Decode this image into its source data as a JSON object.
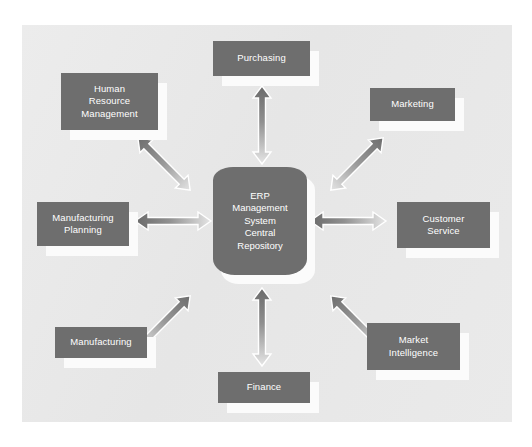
{
  "diagram": {
    "title": "ERP Management System Central Repository",
    "center": {
      "name": "erp-central-repository",
      "label": "ERP\nManagement\nSystem\nCentral\nRepository"
    },
    "colors": {
      "panel_background": "#e9e9e9",
      "canvas_background": "#ffffff",
      "box_fill": "#6e6e6e",
      "box_text": "#ffffff",
      "box_shadow": "#fbfbfb",
      "arrow_dark": "#6f6f6f",
      "arrow_light": "#e3e3e3",
      "arrow_outline": "#ffffff"
    },
    "modules": [
      {
        "id": "purchasing",
        "label": "Purchasing",
        "position": "top"
      },
      {
        "id": "human-resource-management",
        "label": "Human\nResource\nManagement",
        "position": "top-left"
      },
      {
        "id": "marketing",
        "label": "Marketing",
        "position": "top-right"
      },
      {
        "id": "manufacturing-planning",
        "label": "Manufacturing\nPlanning",
        "position": "left"
      },
      {
        "id": "customer-service",
        "label": "Customer\nService",
        "position": "right"
      },
      {
        "id": "manufacturing",
        "label": "Manufacturing",
        "position": "bottom-left"
      },
      {
        "id": "market-intelligence",
        "label": "Market\nIntelligence",
        "position": "bottom-right"
      },
      {
        "id": "finance",
        "label": "Finance",
        "position": "bottom"
      }
    ],
    "connectors": [
      {
        "id": "connector-purchasing",
        "from": "erp-central-repository",
        "to": "purchasing",
        "style": "double-headed-arrow",
        "orientation": "vertical"
      },
      {
        "id": "connector-human-resource-management",
        "from": "erp-central-repository",
        "to": "human-resource-management",
        "style": "double-headed-arrow",
        "orientation": "diagonal"
      },
      {
        "id": "connector-marketing",
        "from": "erp-central-repository",
        "to": "marketing",
        "style": "double-headed-arrow",
        "orientation": "diagonal"
      },
      {
        "id": "connector-manufacturing-planning",
        "from": "erp-central-repository",
        "to": "manufacturing-planning",
        "style": "double-headed-arrow",
        "orientation": "horizontal"
      },
      {
        "id": "connector-customer-service",
        "from": "erp-central-repository",
        "to": "customer-service",
        "style": "double-headed-arrow",
        "orientation": "horizontal"
      },
      {
        "id": "connector-manufacturing",
        "from": "erp-central-repository",
        "to": "manufacturing",
        "style": "double-headed-arrow",
        "orientation": "diagonal"
      },
      {
        "id": "connector-market-intelligence",
        "from": "erp-central-repository",
        "to": "market-intelligence",
        "style": "double-headed-arrow",
        "orientation": "diagonal"
      },
      {
        "id": "connector-finance",
        "from": "erp-central-repository",
        "to": "finance",
        "style": "double-headed-arrow",
        "orientation": "vertical"
      }
    ]
  }
}
